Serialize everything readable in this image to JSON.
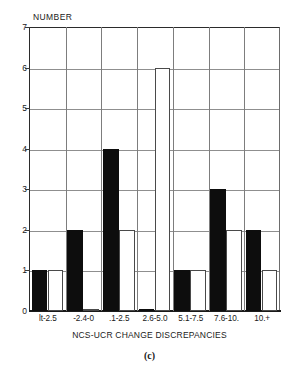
{
  "chart_data": {
    "type": "bar",
    "title": "",
    "categories": [
      "lt-2.5",
      "-2.4-0",
      ".1-2.5",
      "2.6-5.0",
      "5.1-7.5",
      "7.6-10.",
      "10.+"
    ],
    "series": [
      {
        "name": "filled",
        "color": "#0d0d0d",
        "values": [
          1,
          2,
          4,
          0,
          1,
          3,
          2
        ]
      },
      {
        "name": "open",
        "color": "#ffffff",
        "values": [
          1,
          0,
          2,
          6,
          1,
          2,
          1
        ]
      }
    ],
    "xlabel": "NCS-UCR CHANGE DISCREPANCIES",
    "ylabel": "NUMBER",
    "ylim": [
      0,
      7
    ],
    "yticks": [
      0,
      1,
      2,
      3,
      4,
      5,
      6,
      7
    ],
    "ytick_labels": [
      "0",
      "1",
      "2",
      "3",
      "4",
      "5",
      "6",
      "7"
    ],
    "grid": true,
    "legend": "none"
  },
  "caption": "(c)",
  "axis": {
    "y_title": "NUMBER",
    "x_title": "NCS-UCR CHANGE DISCREPANCIES"
  }
}
